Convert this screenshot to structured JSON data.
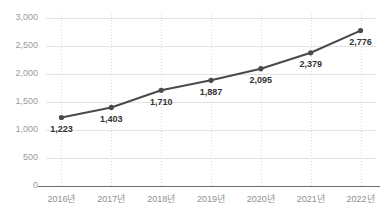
{
  "chart_data": {
    "type": "line",
    "title": "",
    "subtitle": "",
    "xlabel": "",
    "ylabel": "",
    "categories": [
      "2016년",
      "2017년",
      "2018년",
      "2019년",
      "2020년",
      "2021년",
      "2022년"
    ],
    "values": [
      1223,
      1403,
      1710,
      1887,
      2095,
      2379,
      2776
    ],
    "point_labels": [
      "1,223",
      "1,403",
      "1,710",
      "1,887",
      "2,095",
      "2,379",
      "2,776"
    ],
    "ylim": [
      0,
      3000
    ],
    "yticks": [
      0,
      500,
      1000,
      1500,
      2000,
      2500,
      3000
    ],
    "ytick_labels": [
      "0",
      "500",
      "1,000",
      "1,500",
      "2,000",
      "2,500",
      "3,000"
    ],
    "grid": {
      "horizontal": true,
      "vertical": true
    },
    "legend": {
      "visible": false,
      "position": "none",
      "entries": []
    },
    "series": [
      {
        "name": "",
        "values": [
          1223,
          1403,
          1710,
          1887,
          2095,
          2379,
          2776
        ]
      }
    ],
    "colors": {
      "line": "#4a4a4a",
      "marker": "#4a4a4a",
      "grid": "#e2e2e2",
      "vertical_grid": "#dcdcdc",
      "axis": "#6e6e6e",
      "tick_text": "#9a9a9a",
      "label_text": "#333333",
      "background": "#ffffff"
    }
  }
}
